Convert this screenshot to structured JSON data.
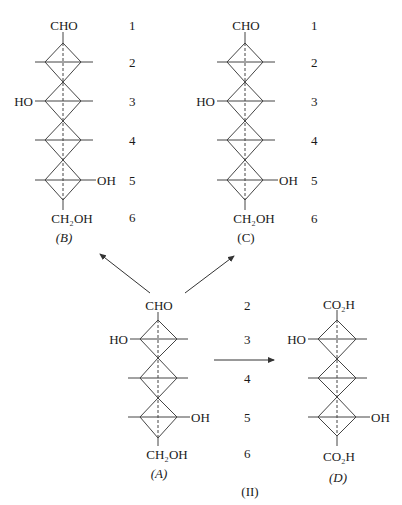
{
  "figure_caption": "(II)",
  "structures": {
    "B": {
      "label": "(B)",
      "top_group": "CHO",
      "bottom_group": "CH₂OH",
      "left_groups": {
        "c3": "HO"
      },
      "right_groups": {
        "c5": "OH"
      },
      "carbon_numbers": [
        "1",
        "2",
        "3",
        "4",
        "5",
        "6"
      ]
    },
    "C": {
      "label": "(C)",
      "top_group": "CHO",
      "bottom_group": "CH₂OH",
      "left_groups": {
        "c3": "HO"
      },
      "right_groups": {
        "c5": "OH"
      },
      "carbon_numbers": [
        "1",
        "2",
        "3",
        "4",
        "5",
        "6"
      ]
    },
    "A": {
      "label": "(A)",
      "top_group": "CHO",
      "bottom_group": "CH₂OH",
      "left_groups": {
        "c3": "HO"
      },
      "right_groups": {
        "c5": "OH"
      },
      "carbon_numbers": [
        "2",
        "3",
        "4",
        "5",
        "6"
      ]
    },
    "D": {
      "label": "(D)",
      "top_group": "CO₂H",
      "bottom_group": "CO₂H",
      "left_groups": {
        "c2": "HO"
      },
      "right_groups": {
        "c4": "OH"
      }
    }
  },
  "arrows": [
    {
      "from": "A",
      "to": "B"
    },
    {
      "from": "A",
      "to": "C"
    },
    {
      "from": "A",
      "to": "D"
    }
  ]
}
